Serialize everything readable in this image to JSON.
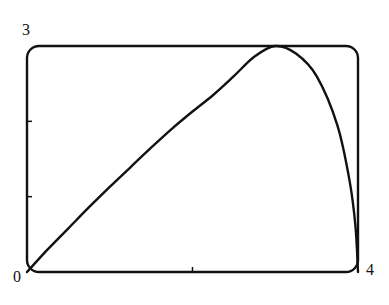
{
  "chart_data": {
    "type": "line",
    "title": "",
    "xlabel": "",
    "ylabel": "",
    "xlim": [
      0,
      4
    ],
    "ylim": [
      0,
      3
    ],
    "grid": false,
    "legend": null,
    "tick_labels": {
      "x_min": "0",
      "x_max": "4",
      "y_max": "3"
    },
    "x_ticks": [
      2
    ],
    "y_ticks": [
      1,
      2
    ],
    "series": [
      {
        "name": "curve",
        "x": [
          0,
          0.25,
          0.5,
          0.75,
          1.0,
          1.25,
          1.5,
          1.75,
          2.0,
          2.25,
          2.5,
          2.75,
          3.0,
          3.25,
          3.5,
          3.75,
          3.9,
          3.97,
          4.0
        ],
        "y": [
          0,
          0.3,
          0.58,
          0.86,
          1.13,
          1.39,
          1.65,
          1.9,
          2.13,
          2.35,
          2.6,
          2.86,
          3.0,
          2.9,
          2.6,
          1.95,
          1.2,
          0.6,
          0
        ]
      }
    ]
  },
  "labels": {
    "origin": "0",
    "x_max": "4",
    "y_max": "3"
  },
  "colors": {
    "line": "#111111",
    "frame": "#111111",
    "background": "#ffffff"
  }
}
